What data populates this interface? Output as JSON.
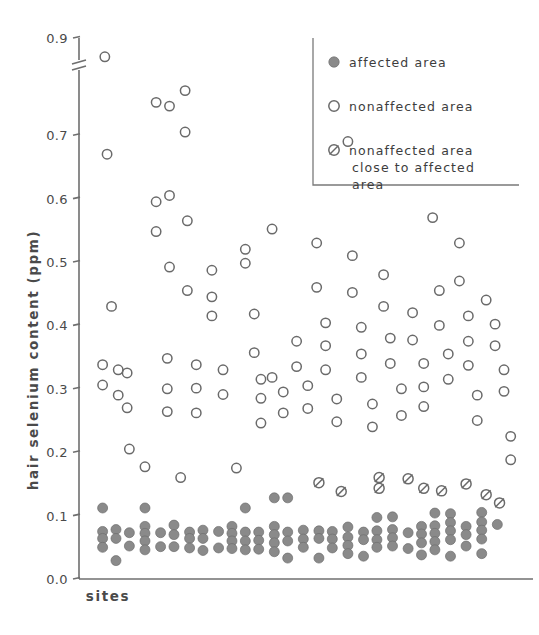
{
  "figure": {
    "width": 539,
    "height": 635,
    "background": "#ffffff",
    "ink_color": "#6a6a6a",
    "filled_color": "#8a8a8a"
  },
  "chart_data": {
    "type": "scatter",
    "title": "",
    "xlabel": "sites",
    "ylabel": "hair selenium content (ppm)",
    "ylim": [
      0.0,
      0.9
    ],
    "xlim": [
      0,
      100
    ],
    "grid": false,
    "y_axis_break": {
      "present": true,
      "between": [
        0.72,
        0.86
      ],
      "note": "axis break between 0.7 and 0.9 tick; 0.8 label omitted"
    },
    "ytick_labels": [
      "0.9",
      "0.7",
      "0.6",
      "0.5",
      "0.4",
      "0.3",
      "0.2",
      "0.1",
      "0.0"
    ],
    "ytick_values": [
      0.9,
      0.7,
      0.6,
      0.5,
      0.4,
      0.3,
      0.2,
      0.1,
      0.0
    ],
    "xtick_labels": [],
    "legend": {
      "position": "top-right",
      "border": "left-and-bottom-only",
      "entries": [
        {
          "marker": "filled-circle",
          "label": "affected  area"
        },
        {
          "marker": "open-circle",
          "label": "nonaffected  area"
        },
        {
          "marker": "slashed-circle",
          "label": "nonaffected area",
          "label2": "close  to  affected",
          "label3": "area"
        }
      ]
    },
    "series": [
      {
        "name": "affected area",
        "marker": "filled-circle",
        "points": [
          [
            3.5,
            0.112
          ],
          [
            3.5,
            0.075
          ],
          [
            3.5,
            0.064
          ],
          [
            3.5,
            0.05
          ],
          [
            6.5,
            0.078
          ],
          [
            6.5,
            0.064
          ],
          [
            6.5,
            0.029
          ],
          [
            9.5,
            0.073
          ],
          [
            9.5,
            0.052
          ],
          [
            13.0,
            0.112
          ],
          [
            13.0,
            0.083
          ],
          [
            13.0,
            0.072
          ],
          [
            13.0,
            0.06
          ],
          [
            13.0,
            0.046
          ],
          [
            16.5,
            0.073
          ],
          [
            16.5,
            0.051
          ],
          [
            19.5,
            0.085
          ],
          [
            19.5,
            0.07
          ],
          [
            19.5,
            0.051
          ],
          [
            23.0,
            0.074
          ],
          [
            23.0,
            0.064
          ],
          [
            23.0,
            0.049
          ],
          [
            26.0,
            0.077
          ],
          [
            26.0,
            0.064
          ],
          [
            26.0,
            0.045
          ],
          [
            29.5,
            0.075
          ],
          [
            29.5,
            0.049
          ],
          [
            32.5,
            0.083
          ],
          [
            32.5,
            0.072
          ],
          [
            32.5,
            0.06
          ],
          [
            32.5,
            0.048
          ],
          [
            35.5,
            0.112
          ],
          [
            35.5,
            0.074
          ],
          [
            35.5,
            0.06
          ],
          [
            35.5,
            0.046
          ],
          [
            38.5,
            0.074
          ],
          [
            38.5,
            0.061
          ],
          [
            38.5,
            0.047
          ],
          [
            42.0,
            0.128
          ],
          [
            42.0,
            0.083
          ],
          [
            42.0,
            0.07
          ],
          [
            42.0,
            0.057
          ],
          [
            42.0,
            0.043
          ],
          [
            45.0,
            0.128
          ],
          [
            45.0,
            0.074
          ],
          [
            45.0,
            0.06
          ],
          [
            45.0,
            0.033
          ],
          [
            48.5,
            0.077
          ],
          [
            48.5,
            0.063
          ],
          [
            48.5,
            0.05
          ],
          [
            52.0,
            0.076
          ],
          [
            52.0,
            0.064
          ],
          [
            52.0,
            0.033
          ],
          [
            55.0,
            0.075
          ],
          [
            55.0,
            0.063
          ],
          [
            55.0,
            0.049
          ],
          [
            58.5,
            0.082
          ],
          [
            58.5,
            0.066
          ],
          [
            58.5,
            0.053
          ],
          [
            58.5,
            0.04
          ],
          [
            62.0,
            0.074
          ],
          [
            62.0,
            0.062
          ],
          [
            62.0,
            0.036
          ],
          [
            65.0,
            0.097
          ],
          [
            65.0,
            0.076
          ],
          [
            65.0,
            0.062
          ],
          [
            65.0,
            0.05
          ],
          [
            68.5,
            0.098
          ],
          [
            68.5,
            0.078
          ],
          [
            68.5,
            0.065
          ],
          [
            68.5,
            0.052
          ],
          [
            72.0,
            0.073
          ],
          [
            72.0,
            0.048
          ],
          [
            75.0,
            0.083
          ],
          [
            75.0,
            0.071
          ],
          [
            75.0,
            0.057
          ],
          [
            75.0,
            0.038
          ],
          [
            78.0,
            0.104
          ],
          [
            78.0,
            0.084
          ],
          [
            78.0,
            0.072
          ],
          [
            78.0,
            0.059
          ],
          [
            78.0,
            0.046
          ],
          [
            81.5,
            0.103
          ],
          [
            81.5,
            0.089
          ],
          [
            81.5,
            0.076
          ],
          [
            81.5,
            0.062
          ],
          [
            81.5,
            0.036
          ],
          [
            85.0,
            0.083
          ],
          [
            85.0,
            0.07
          ],
          [
            85.0,
            0.052
          ],
          [
            88.5,
            0.105
          ],
          [
            88.5,
            0.09
          ],
          [
            88.5,
            0.077
          ],
          [
            88.5,
            0.063
          ],
          [
            88.5,
            0.04
          ],
          [
            92.0,
            0.086
          ]
        ]
      },
      {
        "name": "nonaffected area",
        "marker": "open-circle",
        "points": [
          [
            4.0,
            0.86
          ],
          [
            4.5,
            0.67
          ],
          [
            5.5,
            0.43
          ],
          [
            3.5,
            0.338
          ],
          [
            3.5,
            0.306
          ],
          [
            7.0,
            0.33
          ],
          [
            7.0,
            0.29
          ],
          [
            9.0,
            0.325
          ],
          [
            9.0,
            0.27
          ],
          [
            9.5,
            0.205
          ],
          [
            13.0,
            0.177
          ],
          [
            15.5,
            0.763
          ],
          [
            15.5,
            0.595
          ],
          [
            15.5,
            0.548
          ],
          [
            18.5,
            0.755
          ],
          [
            18.5,
            0.605
          ],
          [
            18.5,
            0.492
          ],
          [
            18.0,
            0.348
          ],
          [
            18.0,
            0.3
          ],
          [
            18.0,
            0.264
          ],
          [
            21.0,
            0.16
          ],
          [
            22.0,
            0.788
          ],
          [
            22.0,
            0.705
          ],
          [
            22.5,
            0.565
          ],
          [
            22.5,
            0.455
          ],
          [
            24.5,
            0.338
          ],
          [
            24.5,
            0.301
          ],
          [
            24.5,
            0.262
          ],
          [
            28.0,
            0.487
          ],
          [
            28.0,
            0.445
          ],
          [
            28.0,
            0.415
          ],
          [
            30.5,
            0.33
          ],
          [
            30.5,
            0.291
          ],
          [
            33.5,
            0.175
          ],
          [
            35.5,
            0.52
          ],
          [
            35.5,
            0.498
          ],
          [
            37.5,
            0.418
          ],
          [
            37.5,
            0.357
          ],
          [
            39.0,
            0.315
          ],
          [
            39.0,
            0.285
          ],
          [
            39.0,
            0.246
          ],
          [
            41.5,
            0.552
          ],
          [
            41.5,
            0.318
          ],
          [
            44.0,
            0.295
          ],
          [
            44.0,
            0.262
          ],
          [
            47.0,
            0.375
          ],
          [
            47.0,
            0.335
          ],
          [
            49.5,
            0.305
          ],
          [
            49.5,
            0.269
          ],
          [
            51.5,
            0.53
          ],
          [
            51.5,
            0.46
          ],
          [
            53.5,
            0.404
          ],
          [
            53.5,
            0.368
          ],
          [
            53.5,
            0.33
          ],
          [
            56.0,
            0.284
          ],
          [
            56.0,
            0.248
          ],
          [
            58.5,
            0.69
          ],
          [
            59.5,
            0.51
          ],
          [
            59.5,
            0.452
          ],
          [
            61.5,
            0.397
          ],
          [
            61.5,
            0.355
          ],
          [
            61.5,
            0.318
          ],
          [
            64.0,
            0.276
          ],
          [
            64.0,
            0.24
          ],
          [
            66.5,
            0.48
          ],
          [
            66.5,
            0.43
          ],
          [
            68.0,
            0.38
          ],
          [
            68.0,
            0.34
          ],
          [
            70.5,
            0.3
          ],
          [
            70.5,
            0.258
          ],
          [
            73.0,
            0.42
          ],
          [
            73.0,
            0.377
          ],
          [
            75.5,
            0.34
          ],
          [
            75.5,
            0.303
          ],
          [
            75.5,
            0.272
          ],
          [
            77.5,
            0.57
          ],
          [
            79.0,
            0.455
          ],
          [
            79.0,
            0.4
          ],
          [
            81.0,
            0.355
          ],
          [
            81.0,
            0.315
          ],
          [
            83.5,
            0.53
          ],
          [
            83.5,
            0.47
          ],
          [
            85.5,
            0.415
          ],
          [
            85.5,
            0.375
          ],
          [
            85.5,
            0.337
          ],
          [
            87.5,
            0.29
          ],
          [
            87.5,
            0.25
          ],
          [
            89.5,
            0.44
          ],
          [
            91.5,
            0.402
          ],
          [
            91.5,
            0.368
          ],
          [
            93.5,
            0.33
          ],
          [
            93.5,
            0.296
          ],
          [
            95.0,
            0.225
          ],
          [
            95.0,
            0.188
          ]
        ]
      },
      {
        "name": "nonaffected area close to affected area",
        "marker": "slashed-circle",
        "points": [
          [
            52.0,
            0.152
          ],
          [
            57.0,
            0.138
          ],
          [
            65.5,
            0.16
          ],
          [
            65.5,
            0.143
          ],
          [
            72.0,
            0.158
          ],
          [
            75.5,
            0.143
          ],
          [
            79.5,
            0.139
          ],
          [
            85.0,
            0.15
          ],
          [
            89.5,
            0.133
          ],
          [
            92.5,
            0.12
          ]
        ]
      }
    ]
  }
}
